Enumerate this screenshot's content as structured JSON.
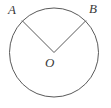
{
  "figure": {
    "type": "geometry-diagram",
    "background_color": "#ffffff",
    "stroke_color": "#5a5a5a",
    "label_color": "#3a3a3a",
    "stroke_width": 1,
    "circle": {
      "name": "circle",
      "center_x": 54,
      "center_y": 52.5,
      "radius": 44.5
    },
    "labels": {
      "a": "A",
      "b": "B",
      "o": "O"
    },
    "points": {
      "a": {
        "x": 22,
        "y": 20.5
      },
      "b": {
        "x": 86,
        "y": 20.5
      },
      "o": {
        "x": 54,
        "y": 52.5
      }
    },
    "segments": [
      {
        "name": "radius-oa",
        "x1": 54,
        "y1": 52.5,
        "x2": 22,
        "y2": 20.5
      },
      {
        "name": "radius-ob",
        "x1": 54,
        "y1": 52.5,
        "x2": 86,
        "y2": 20.5
      }
    ]
  }
}
